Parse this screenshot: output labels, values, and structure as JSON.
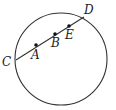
{
  "diagram": {
    "type": "circle-with-chord",
    "stroke_color": "#333333",
    "circle": {
      "cx": 61,
      "cy": 59,
      "r": 46
    },
    "chord": {
      "from": "C",
      "to": "D"
    },
    "points": [
      {
        "id": "C",
        "label": "C",
        "x": 16,
        "y": 60,
        "on_circle": true,
        "dot": false,
        "label_x": 2,
        "label_y": 66
      },
      {
        "id": "A",
        "label": "A",
        "x": 36,
        "y": 45,
        "on_circle": false,
        "dot": true,
        "label_x": 31,
        "label_y": 59
      },
      {
        "id": "B",
        "label": "B",
        "x": 55,
        "y": 34,
        "on_circle": false,
        "dot": true,
        "label_x": 51,
        "label_y": 47
      },
      {
        "id": "E",
        "label": "E",
        "x": 69,
        "y": 26,
        "on_circle": false,
        "dot": true,
        "label_x": 65,
        "label_y": 39
      },
      {
        "id": "D",
        "label": "D",
        "x": 84,
        "y": 17,
        "on_circle": true,
        "dot": false,
        "label_x": 84,
        "label_y": 14
      }
    ]
  }
}
